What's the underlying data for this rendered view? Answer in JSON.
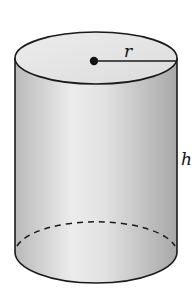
{
  "figure": {
    "labels": {
      "radius": "r",
      "height": "h"
    },
    "colors": {
      "stroke": "#1a1a1a",
      "top_face": "#e4e4e4",
      "body_light": "#eeeeee",
      "body_dark": "#a9a9a9"
    }
  }
}
